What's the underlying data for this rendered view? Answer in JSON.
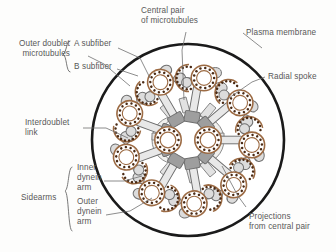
{
  "figure": {
    "background_color": "#fdfdfc"
  },
  "colors": {
    "membrane": "#1a1a1a",
    "microtubule_wall": "#9c6b44",
    "protofilament_dot": "#4a2a14",
    "microtubule_fill": "#ffffff",
    "spoke_fill": "#e8e8e8",
    "spoke_stroke": "#6d6d6d",
    "spoke_head": "#9a9a9a",
    "dynein_fill": "#dcdcdc",
    "dynein_stroke": "#707070",
    "sheath_fill": "#f0f0ee",
    "label_text": "#585858",
    "leader_line": "#707070"
  },
  "structure": {
    "outer_doublet_count": 9,
    "central_pair_count": 2,
    "protofilaments_per_ring": 13,
    "center_x": 188,
    "center_y": 140,
    "membrane_radius": 96,
    "doublet_ring_radius": 62
  },
  "labels": {
    "outer_doublet": {
      "line1": "Outer doublet",
      "line2": "microtubules"
    },
    "a_subfiber": "A subfiber",
    "b_subfiber": "B subfiber",
    "central_pair": {
      "line1": "Central pair",
      "line2": "of microtubules"
    },
    "plasma_membrane": "Plasma membrane",
    "radial_spoke": "Radial  spoke",
    "interdoublet_link": {
      "line1": "Interdoublet",
      "line2": "link"
    },
    "sidearms": "Sidearms",
    "inner_dynein_arm": {
      "line1": "Inner",
      "line2": "dynein",
      "line3": "arm"
    },
    "outer_dynein_arm": {
      "line1": "Outer",
      "line2": "dynein",
      "line3": "arm"
    },
    "projections": {
      "line1": "Projections",
      "line2": "from central pair"
    }
  }
}
